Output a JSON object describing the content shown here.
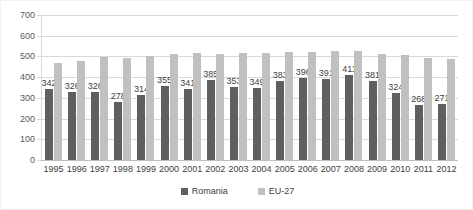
{
  "chart_data": {
    "type": "bar",
    "title": "",
    "subtitle": "",
    "xlabel": "",
    "ylabel": "",
    "ylim": [
      0,
      700
    ],
    "ytick_step": 100,
    "yticks": [
      0,
      100,
      200,
      300,
      400,
      500,
      600,
      700
    ],
    "grid": true,
    "legend_position": "bottom-center",
    "categories": [
      "1995",
      "1996",
      "1997",
      "1998",
      "1999",
      "2000",
      "2001",
      "2002",
      "2003",
      "2004",
      "2005",
      "2006",
      "2007",
      "2008",
      "2009",
      "2010",
      "2011",
      "2012"
    ],
    "series": [
      {
        "name": "Romania",
        "color": "#5f5f5f",
        "labels_shown": true,
        "values": [
          342,
          326,
          326,
          278,
          314,
          355,
          341,
          385,
          353,
          349,
          383,
          396,
          391,
          411,
          381,
          324,
          268,
          271
        ]
      },
      {
        "name": "EU-27",
        "color": "#c0c0c0",
        "labels_shown": false,
        "values": [
          470,
          480,
          495,
          492,
          503,
          511,
          518,
          514,
          516,
          519,
          521,
          523,
          525,
          524,
          512,
          505,
          492,
          490
        ]
      }
    ]
  },
  "axis": {
    "y_tick_labels": [
      "700",
      "600",
      "500",
      "400",
      "300",
      "200",
      "100",
      "0"
    ]
  },
  "legend": {
    "items": [
      {
        "label": "Romania",
        "color": "#5f5f5f"
      },
      {
        "label": "EU-27",
        "color": "#c0c0c0"
      }
    ]
  }
}
